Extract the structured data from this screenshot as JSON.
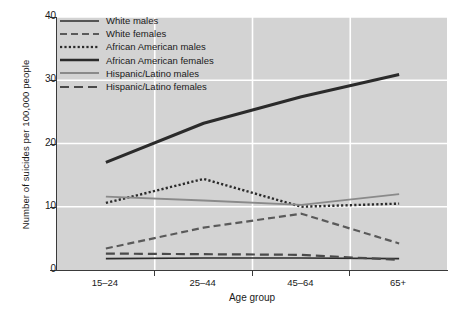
{
  "chart_data": {
    "type": "line",
    "title": "",
    "xlabel": "Age group",
    "ylabel": "Number of suicides per 100,000 people",
    "categories": [
      "15–24",
      "25–44",
      "45–64",
      "65+"
    ],
    "ylim": [
      0,
      40
    ],
    "yticks": [
      0,
      10,
      20,
      30,
      40
    ],
    "ytick_labels": [
      "0",
      "10",
      "20",
      "30",
      "40"
    ],
    "grid": true,
    "grid_color": "#ffffff",
    "plot_background": "#d3d3d3",
    "legend_position": "upper left",
    "series": [
      {
        "name": "White males",
        "values": [
          1.8,
          1.9,
          1.9,
          1.8
        ],
        "style": "solid",
        "width": 1.6,
        "color": "#2b2b2b"
      },
      {
        "name": "White females",
        "values": [
          3.4,
          6.7,
          8.9,
          4.2
        ],
        "style": "dashed",
        "width": 2.2,
        "color": "#5a5a5a"
      },
      {
        "name": "African American males",
        "values": [
          10.6,
          14.4,
          10.0,
          10.5
        ],
        "style": "dotted",
        "width": 2.4,
        "color": "#2b2b2b"
      },
      {
        "name": "African American females",
        "values": [
          17.0,
          23.2,
          27.4,
          30.9
        ],
        "style": "solid",
        "width": 3.0,
        "color": "#2b2b2b"
      },
      {
        "name": "Hispanic/Latino males",
        "values": [
          11.6,
          11.0,
          10.3,
          12.0
        ],
        "style": "solid",
        "width": 1.9,
        "color": "#8a8a8a"
      },
      {
        "name": "Hispanic/Latino females",
        "values": [
          2.6,
          2.5,
          2.4,
          1.6
        ],
        "style": "longdash",
        "width": 2.2,
        "color": "#4a4a4a"
      }
    ]
  },
  "legend": {
    "items": [
      {
        "label": "White males"
      },
      {
        "label": "White females"
      },
      {
        "label": "African American males"
      },
      {
        "label": "African American females"
      },
      {
        "label": "Hispanic/Latino males"
      },
      {
        "label": "Hispanic/Latino females"
      }
    ]
  },
  "axes": {
    "x_title": "Age group",
    "y_title": "Number of suicides per 100,000 people",
    "x_tick_labels": [
      "15–24",
      "25–44",
      "45–64",
      "65+"
    ],
    "y_tick_labels": [
      "40",
      "30",
      "20",
      "10",
      "0"
    ]
  }
}
